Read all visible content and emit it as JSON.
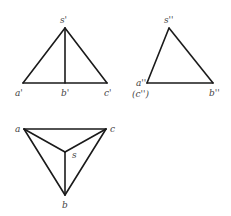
{
  "diagram": {
    "type": "orthographic-projection",
    "colors": {
      "line": "#1a1a1a",
      "label": "#444444",
      "background": "#ffffff"
    },
    "views": {
      "front": {
        "labels": {
          "s": "s'",
          "a": "a'",
          "b": "b'",
          "c": "c'"
        },
        "points": {
          "s": [
            65,
            28
          ],
          "a": [
            23,
            83
          ],
          "b": [
            65,
            83
          ],
          "c": [
            107,
            83
          ]
        }
      },
      "side": {
        "labels": {
          "s": "s''",
          "a": "a''",
          "c": "(c'')",
          "b": "b''"
        },
        "points": {
          "s": [
            169,
            28
          ],
          "a": [
            147,
            83
          ],
          "b": [
            213,
            83
          ]
        }
      },
      "top": {
        "labels": {
          "a": "a",
          "c": "c",
          "s": "s",
          "b": "b"
        },
        "points": {
          "a": [
            24,
            129
          ],
          "c": [
            106,
            129
          ],
          "s": [
            65,
            152
          ],
          "b": [
            65,
            195
          ]
        }
      }
    }
  }
}
